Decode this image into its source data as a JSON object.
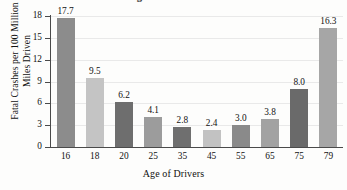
{
  "figure": {
    "title_partial": "Driver Age and Fatal Crashes",
    "background_color": "#fdfdfc"
  },
  "chart_data": {
    "type": "bar",
    "title": "Driver Age and Fatal Crashes",
    "xlabel": "Age of Drivers",
    "ylabel": "Fatal Crashes per 100 Million Miles Driven",
    "categories": [
      "16",
      "18",
      "20",
      "25",
      "35",
      "45",
      "55",
      "65",
      "75",
      "79"
    ],
    "values": [
      17.7,
      9.5,
      6.2,
      4.1,
      2.8,
      2.4,
      3.0,
      3.8,
      8.0,
      16.3
    ],
    "value_labels": [
      "17.7",
      "9.5",
      "6.2",
      "4.1",
      "2.8",
      "2.4",
      "3.0",
      "3.8",
      "8.0",
      "16.3"
    ],
    "bar_colors": [
      "#8c8c8c",
      "#c4c4c4",
      "#6e6e6e",
      "#9c9c9c",
      "#6f6f6f",
      "#c2c2c2",
      "#8a8a8a",
      "#a2a2a2",
      "#6a6a6a",
      "#a6a6a6"
    ],
    "ylim": [
      0,
      18
    ],
    "yticks": [
      0,
      3,
      6,
      9,
      12,
      15,
      18
    ],
    "ytick_labels": [
      "0",
      "3",
      "6",
      "9",
      "12",
      "15",
      "18"
    ],
    "grid": true,
    "grid_color": "#e9e9e9",
    "legend": "none",
    "axis_color": "#4a4a4a"
  }
}
